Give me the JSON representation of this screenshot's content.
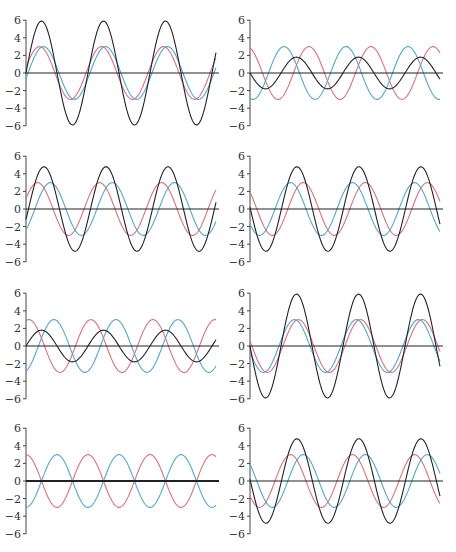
{
  "colors": {
    "red": "#d9707f",
    "blue": "#4fa8cf",
    "black": "#222222",
    "axis": "#444444"
  },
  "layout": {
    "columns_x0": [
      26,
      250
    ],
    "axis_width": 193,
    "rows_zero_y": [
      73,
      209,
      346,
      481
    ],
    "px_per_unit": 8.8,
    "period_px": 62,
    "wave_length_px": 190
  },
  "chart_data": [
    {
      "type": "line",
      "panel": 1,
      "title": "",
      "ylabel": "",
      "xlabel": "",
      "yticks": [
        6,
        4,
        2,
        0,
        -2,
        -4,
        -6
      ],
      "ylim": [
        -6,
        6
      ],
      "grid": false,
      "cycles": 3.07,
      "series": [
        {
          "name": "wave1",
          "color": "red",
          "amplitude": 3,
          "phase": 0.2
        },
        {
          "name": "wave2",
          "color": "blue",
          "amplitude": 3,
          "phase": -0.2
        },
        {
          "name": "sum",
          "color": "black",
          "amplitude": 5.9,
          "phase": 0.0
        }
      ]
    },
    {
      "type": "line",
      "panel": 2,
      "yticks": [
        6,
        4,
        2,
        0,
        -2,
        -4,
        -6
      ],
      "ylim": [
        -6,
        6
      ],
      "grid": false,
      "cycles": 3.07,
      "series": [
        {
          "name": "wave1",
          "color": "red",
          "amplitude": 3,
          "phase": 1.875
        },
        {
          "name": "wave2",
          "color": "blue",
          "amplitude": 3,
          "phase": -1.875
        },
        {
          "name": "sum",
          "color": "black",
          "amplitude": -1.8,
          "phase": 0.0
        }
      ]
    },
    {
      "type": "line",
      "panel": 3,
      "yticks": [
        6,
        4,
        2,
        0,
        -2,
        -4,
        -6
      ],
      "ylim": [
        -6,
        6
      ],
      "grid": false,
      "cycles": 3.07,
      "series": [
        {
          "name": "wave1",
          "color": "red",
          "amplitude": 3,
          "phase": 0.4
        },
        {
          "name": "wave2",
          "color": "blue",
          "amplitude": 3,
          "phase": -0.9
        },
        {
          "name": "sum",
          "color": "black",
          "amplitude": 4.8,
          "phase": -0.25
        }
      ]
    },
    {
      "type": "line",
      "panel": 4,
      "yticks": [
        6,
        4,
        2,
        0,
        -2,
        -4,
        -6
      ],
      "ylim": [
        -6,
        6
      ],
      "grid": false,
      "cycles": 3.07,
      "series": [
        {
          "name": "wave1",
          "color": "red",
          "amplitude": 3,
          "phase": 2.45
        },
        {
          "name": "wave2",
          "color": "blue",
          "amplitude": 3,
          "phase": 3.75
        },
        {
          "name": "sum",
          "color": "black",
          "amplitude": 4.8,
          "phase": 3.1
        }
      ]
    },
    {
      "type": "line",
      "panel": 5,
      "yticks": [
        6,
        4,
        2,
        0,
        -2,
        -4,
        -6
      ],
      "ylim": [
        -6,
        6
      ],
      "grid": false,
      "cycles": 3.07,
      "series": [
        {
          "name": "wave1",
          "color": "red",
          "amplitude": 3,
          "phase": 1.27
        },
        {
          "name": "wave2",
          "color": "blue",
          "amplitude": 3,
          "phase": 5.02
        },
        {
          "name": "sum",
          "color": "black",
          "amplitude": 1.8,
          "phase": 0.0
        }
      ]
    },
    {
      "type": "line",
      "panel": 6,
      "yticks": [
        6,
        4,
        2,
        0,
        -2,
        -4,
        -6
      ],
      "ylim": [
        -6,
        6
      ],
      "grid": false,
      "cycles": 3.07,
      "series": [
        {
          "name": "wave1",
          "color": "red",
          "amplitude": 3,
          "phase": 2.95
        },
        {
          "name": "wave2",
          "color": "blue",
          "amplitude": 3,
          "phase": 3.35
        },
        {
          "name": "sum",
          "color": "black",
          "amplitude": 5.9,
          "phase": 3.14
        }
      ]
    },
    {
      "type": "line",
      "panel": 7,
      "yticks": [
        6,
        4,
        2,
        0,
        -2,
        -4,
        -6
      ],
      "ylim": [
        -6,
        6
      ],
      "grid": false,
      "cycles": 3.07,
      "series": [
        {
          "name": "wave1",
          "color": "red",
          "amplitude": 3,
          "phase": 1.5708
        },
        {
          "name": "wave2",
          "color": "blue",
          "amplitude": 3,
          "phase": -1.5708
        },
        {
          "name": "sum",
          "color": "black",
          "amplitude": 0,
          "phase": 0.0
        }
      ]
    },
    {
      "type": "line",
      "panel": 8,
      "yticks": [
        6,
        4,
        2,
        0,
        -2,
        -4,
        -6
      ],
      "ylim": [
        -6,
        6
      ],
      "grid": false,
      "cycles": 3.07,
      "series": [
        {
          "name": "wave1",
          "color": "red",
          "amplitude": 3,
          "phase": 3.75
        },
        {
          "name": "wave2",
          "color": "blue",
          "amplitude": 3,
          "phase": 2.45
        },
        {
          "name": "sum",
          "color": "black",
          "amplitude": 4.8,
          "phase": 3.1
        }
      ]
    }
  ]
}
